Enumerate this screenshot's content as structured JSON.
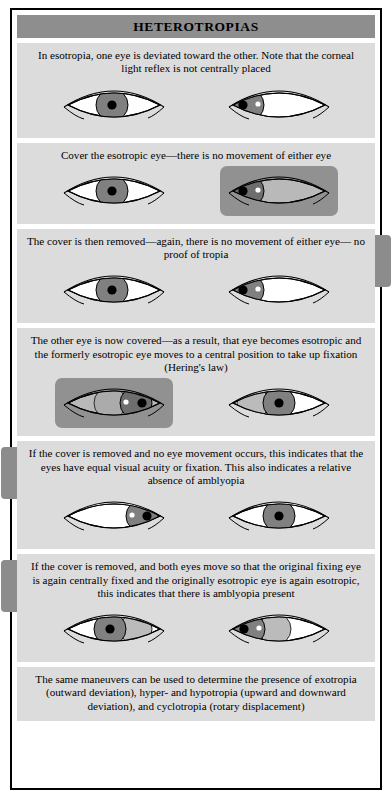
{
  "header": {
    "title": "HETEROTROPIAS"
  },
  "colors": {
    "header_band": "#8e8e8e",
    "panel_background": "#dcdcdc",
    "page_background": "#ffffff",
    "frame_border": "#000000",
    "iris": "#808080",
    "iris_ghost": "#b4b4b4",
    "pupil": "#000000",
    "sclera": "#ffffff",
    "cover_patch": "#919191",
    "light_reflex": "#ffffff",
    "side_tab": "#8c8c8c"
  },
  "panels": [
    {
      "id": "panel-1-esotropia",
      "caption": "In esotropia, one eye is deviated toward the other. Note that the corneal light reflex is not centrally placed",
      "left_eye": {
        "covered": false,
        "iris_position": "central",
        "light_reflex": "central",
        "ghost": false
      },
      "right_eye": {
        "covered": false,
        "iris_position": "nasal-deviated",
        "light_reflex": "displaced-temporal",
        "ghost": false
      }
    },
    {
      "id": "panel-2-cover-esotropic-eye",
      "caption": "Cover the esotropic eye—there is no movement of either eye",
      "left_eye": {
        "covered": false,
        "iris_position": "central",
        "light_reflex": "none",
        "ghost": false
      },
      "right_eye": {
        "covered": true,
        "iris_position": "nasal-deviated",
        "light_reflex": "displaced-temporal",
        "ghost": false
      }
    },
    {
      "id": "panel-3-cover-removed",
      "caption": "The cover is then removed—again, there is no movement of either eye— no proof of tropia",
      "left_eye": {
        "covered": false,
        "iris_position": "central",
        "light_reflex": "none",
        "ghost": false
      },
      "right_eye": {
        "covered": false,
        "iris_position": "nasal-deviated",
        "light_reflex": "displaced-temporal",
        "ghost": false
      },
      "side_tab": "right"
    },
    {
      "id": "panel-4-other-eye-covered",
      "caption": "The other eye is now covered—as a result, that eye becomes esotropic and the formerly esotropic eye moves to a central position to take up fixation (Hering's law)",
      "left_eye": {
        "covered": true,
        "iris_position": "temporal-deviated",
        "light_reflex": "displaced-nasal",
        "ghost": true
      },
      "right_eye": {
        "covered": false,
        "iris_position": "central",
        "light_reflex": "none",
        "ghost": true
      }
    },
    {
      "id": "panel-5-no-movement-no-amblyopia",
      "caption": "If the cover is removed and no eye movement occurs, this indicates that the eyes have equal visual acuity or fixation. This also indicates a relative absence of amblyopia",
      "left_eye": {
        "covered": false,
        "iris_position": "temporal-deviated",
        "light_reflex": "displaced-nasal",
        "ghost": false
      },
      "right_eye": {
        "covered": false,
        "iris_position": "central",
        "light_reflex": "none",
        "ghost": false
      },
      "side_tab": "left"
    },
    {
      "id": "panel-6-amblyopia-present",
      "caption": "If the cover is removed, and both eyes move so that the original fixing eye is again centrally fixed and the originally esotropic eye is again esotropic, this indicates that there is amblyopia present",
      "left_eye": {
        "covered": false,
        "iris_position": "central",
        "light_reflex": "none",
        "ghost": true
      },
      "right_eye": {
        "covered": false,
        "iris_position": "nasal-deviated",
        "light_reflex": "displaced-temporal",
        "ghost": true
      },
      "side_tab": "left"
    },
    {
      "id": "panel-7-other-deviations",
      "caption": "The same maneuvers can be used to determine the presence of exotropia (outward deviation), hyper- and hypotropia (upward and downward deviation), and cyclotropia (rotary displacement)",
      "left_eye": null,
      "right_eye": null
    }
  ]
}
